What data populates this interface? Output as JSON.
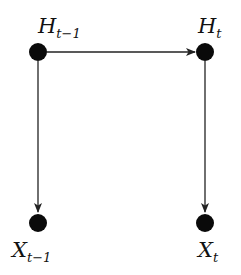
{
  "diagram": {
    "type": "graphical-model",
    "nodes": [
      {
        "id": "H_prev",
        "label": "H",
        "subscript": "t−1",
        "x": 38,
        "y": 52,
        "label_pos": "above"
      },
      {
        "id": "H_curr",
        "label": "H",
        "subscript": "t",
        "x": 205,
        "y": 52,
        "label_pos": "above"
      },
      {
        "id": "X_prev",
        "label": "X",
        "subscript": "t−1",
        "x": 38,
        "y": 223,
        "label_pos": "below"
      },
      {
        "id": "X_curr",
        "label": "X",
        "subscript": "t",
        "x": 205,
        "y": 223,
        "label_pos": "below"
      }
    ],
    "edges": [
      {
        "from": "H_prev",
        "to": "H_curr"
      },
      {
        "from": "H_prev",
        "to": "X_prev"
      },
      {
        "from": "H_curr",
        "to": "X_curr"
      }
    ],
    "colors": {
      "node": "#0a0a0a",
      "edge": "#222222",
      "background": "#ffffff"
    }
  }
}
